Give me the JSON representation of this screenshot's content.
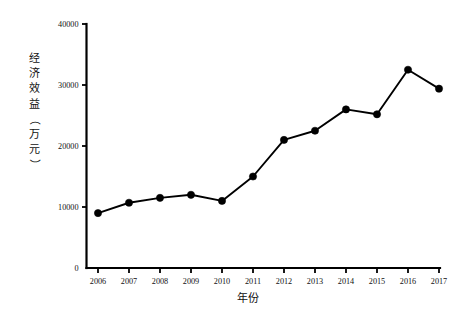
{
  "chart_data": {
    "type": "line",
    "title": "",
    "xlabel": "年份",
    "ylabel": "经济效益（万元）",
    "ylabel_chars": [
      "经",
      "济",
      "效",
      "益",
      "（",
      "万",
      "元",
      "）"
    ],
    "categories": [
      "2006",
      "2007",
      "2008",
      "2009",
      "2010",
      "2011",
      "2012",
      "2013",
      "2014",
      "2015",
      "2016",
      "2017"
    ],
    "values": [
      9000,
      10700,
      11500,
      12000,
      11000,
      15000,
      21000,
      22500,
      26000,
      25200,
      32500,
      29400
    ],
    "series": [
      {
        "name": "经济效益",
        "values": [
          9000,
          10700,
          11500,
          12000,
          11000,
          15000,
          21000,
          22500,
          26000,
          25200,
          32500,
          29400
        ]
      }
    ],
    "ylim": [
      0,
      40000
    ],
    "yticks": [
      0,
      10000,
      20000,
      30000,
      40000
    ],
    "ytick_labels": [
      "0",
      "10000",
      "20000",
      "30000",
      "40000"
    ],
    "xtick_labels": [
      "2006",
      "2007",
      "2008",
      "2009",
      "2010",
      "2011",
      "2012",
      "2013",
      "2014",
      "2015",
      "2016",
      "2017"
    ],
    "grid": false,
    "legend": false,
    "legend_position": "none",
    "marker": "filled-circle",
    "line_color": "#000000",
    "marker_color": "#000000",
    "background_color": "#ffffff"
  }
}
